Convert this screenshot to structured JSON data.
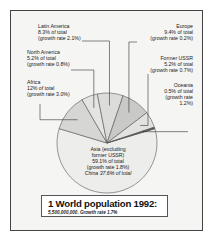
{
  "chart_data": {
    "type": "pie",
    "title": "1 World population 1992:",
    "subtitle": "5,500,000,000. Growth rate 1.7%",
    "unit": "% of world total",
    "slices": [
      {
        "name": "Asia (excluding former USSR)",
        "value": 59.1,
        "growth_rate": 1.8,
        "note": "China 37.6% of total",
        "lines": [
          "Asia (excluding",
          "former USSR)",
          "59.1% of total",
          "(growth rate 1.8%)",
          "China 37.6% of total"
        ],
        "color": "#ededec"
      },
      {
        "name": "Africa",
        "value": 12,
        "growth_rate": 3.0,
        "lines": [
          "Africa",
          "12% of total",
          "(growth rate 3.0%)"
        ],
        "color": "#d6d6d5"
      },
      {
        "name": "North America",
        "value": 5.2,
        "growth_rate": 0.8,
        "lines": [
          "North America",
          "5.2% of total",
          "(growth rate 0.8%)"
        ],
        "color": "#e4e4e3"
      },
      {
        "name": "Latin America",
        "value": 8.3,
        "growth_rate": 2.1,
        "lines": [
          "Latin America",
          "8.3% of total",
          "(growth rate 2.1%)"
        ],
        "color": "#dcdcdb"
      },
      {
        "name": "Europe",
        "value": 9.4,
        "growth_rate": 0.2,
        "lines": [
          "Europe",
          "9.4% of total",
          "(growth rate 0.2%)"
        ],
        "color": "#c9c9c8"
      },
      {
        "name": "Former USSR",
        "value": 5.2,
        "growth_rate": 0.7,
        "lines": [
          "Former USSR",
          "5.2% of total",
          "(growth rate 0.7%)"
        ],
        "color": "#e2e2e1"
      },
      {
        "name": "Oceania",
        "value": 0.5,
        "growth_rate": 1.2,
        "lines": [
          "Oceania",
          "0.5% of total",
          "(growth rate",
          "1.2%)"
        ],
        "color": "#555555"
      }
    ]
  },
  "caption": {
    "title": "1 World population 1992:",
    "subtitle": "5,500,000,000. Growth rate 1.7%"
  }
}
